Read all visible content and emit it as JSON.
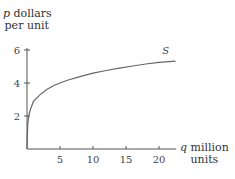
{
  "chart_data": {
    "type": "line",
    "title": "",
    "xlabel": "q million units",
    "ylabel": "p dollars per unit",
    "xlabel_lines": [
      "q million",
      "units"
    ],
    "ylabel_lines": [
      "p dollars",
      "per unit"
    ],
    "xlabel_var": "q",
    "ylabel_var": "p",
    "x_ticks": [
      5,
      10,
      15,
      20
    ],
    "y_ticks": [
      2,
      4,
      6
    ],
    "xlim": [
      0,
      22.5
    ],
    "ylim": [
      0,
      6.1
    ],
    "grid": false,
    "legend": null,
    "series": [
      {
        "name": "S",
        "x": [
          0,
          0.1,
          0.3,
          0.6,
          1,
          1.5,
          2,
          3,
          4,
          5,
          6,
          8,
          10,
          12,
          14,
          16,
          18,
          20,
          22.5
        ],
        "values": [
          0,
          1.5,
          2.1,
          2.5,
          2.9,
          3.1,
          3.3,
          3.6,
          3.83,
          4.0,
          4.15,
          4.38,
          4.6,
          4.76,
          4.9,
          5.03,
          5.15,
          5.25,
          5.33
        ]
      }
    ],
    "annotations": [
      {
        "text": "S",
        "x": 20.5,
        "y": 5.75
      }
    ]
  }
}
